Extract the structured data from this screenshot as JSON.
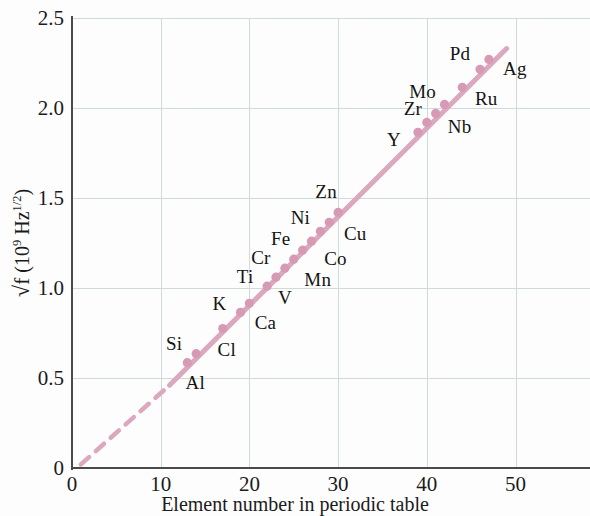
{
  "chart_data": {
    "type": "scatter",
    "title": "",
    "xlabel": "Element number in periodic table",
    "ylabel": "√f  (10⁹ Hz¹ᐟ²)",
    "ylabel_parts": {
      "radical": "√f",
      "units_open": "  (10",
      "units_exp1": "9",
      "units_mid": " Hz",
      "units_exp2": "1/2",
      "units_close": ")"
    },
    "xlim": [
      0,
      58
    ],
    "ylim": [
      0,
      2.5
    ],
    "xticks": [
      0,
      10,
      20,
      30,
      40,
      50
    ],
    "xtick_labels": [
      "0",
      "10",
      "20",
      "30",
      "40",
      "50"
    ],
    "yticks": [
      0,
      0.5,
      1.0,
      1.5,
      2.0,
      2.5
    ],
    "ytick_labels": [
      "0",
      "0.5",
      "1.0",
      "1.5",
      "2.0",
      "2.5"
    ],
    "grid": true,
    "grid_color": "#cfdbda",
    "line_color": "#dba8bf",
    "marker_color": "#d79ab4",
    "axis_color": "#4a4a4a",
    "legend": "none",
    "extrapolation": {
      "style": "dashed",
      "from_x": 1,
      "from_y": 0.02,
      "to_x": 11,
      "to_y": 0.46,
      "note": "dashed extension of the fitted line back toward the origin"
    },
    "fit_line": {
      "style": "solid",
      "from_x": 11,
      "from_y": 0.46,
      "to_x": 49,
      "to_y": 2.33
    },
    "points": [
      {
        "label": "Al",
        "x": 13,
        "y": 0.585,
        "label_dx": 8,
        "label_dy": 20
      },
      {
        "label": "Si",
        "x": 14,
        "y": 0.635,
        "label_dx": -22,
        "label_dy": -10
      },
      {
        "label": "Cl",
        "x": 17,
        "y": 0.775,
        "label_dx": 4,
        "label_dy": 21
      },
      {
        "label": "K",
        "x": 19,
        "y": 0.865,
        "label_dx": -21,
        "label_dy": -8
      },
      {
        "label": "Ca",
        "x": 20,
        "y": 0.915,
        "label_dx": 16,
        "label_dy": 20
      },
      {
        "label": "Ti",
        "x": 22,
        "y": 1.01,
        "label_dx": -22,
        "label_dy": -9
      },
      {
        "label": "V",
        "x": 23,
        "y": 1.06,
        "label_dx": 9,
        "label_dy": 21
      },
      {
        "label": "Cr",
        "x": 24,
        "y": 1.11,
        "label_dx": -24,
        "label_dy": -10
      },
      {
        "label": "Mn",
        "x": 25,
        "y": 1.16,
        "label_dx": 24,
        "label_dy": 21
      },
      {
        "label": "Fe",
        "x": 26,
        "y": 1.21,
        "label_dx": -22,
        "label_dy": -11
      },
      {
        "label": "Co",
        "x": 27,
        "y": 1.26,
        "label_dx": 24,
        "label_dy": 18
      },
      {
        "label": "Ni",
        "x": 28,
        "y": 1.315,
        "label_dx": -20,
        "label_dy": -13
      },
      {
        "label": "Cu",
        "x": 29,
        "y": 1.365,
        "label_dx": 26,
        "label_dy": 12
      },
      {
        "label": "Zn",
        "x": 30,
        "y": 1.42,
        "label_dx": -12,
        "label_dy": -20
      },
      {
        "label": "Y",
        "x": 39,
        "y": 1.865,
        "label_dx": -24,
        "label_dy": 8
      },
      {
        "label": "Zr",
        "x": 40,
        "y": 1.92,
        "label_dx": -14,
        "label_dy": -13
      },
      {
        "label": "Nb",
        "x": 41,
        "y": 1.97,
        "label_dx": 24,
        "label_dy": 14
      },
      {
        "label": "Mo",
        "x": 42,
        "y": 2.02,
        "label_dx": -22,
        "label_dy": -12
      },
      {
        "label": "Ru",
        "x": 44,
        "y": 2.115,
        "label_dx": 24,
        "label_dy": 12
      },
      {
        "label": "Pd",
        "x": 46,
        "y": 2.215,
        "label_dx": -20,
        "label_dy": -15
      },
      {
        "label": "Ag",
        "x": 47,
        "y": 2.27,
        "label_dx": 26,
        "label_dy": 10
      }
    ]
  }
}
